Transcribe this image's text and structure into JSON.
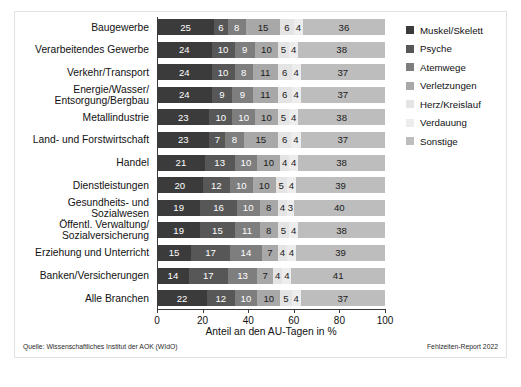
{
  "chart_data": {
    "type": "bar",
    "orientation": "horizontal",
    "stacked": true,
    "normalized_percent": true,
    "title": "",
    "xlabel": "Anteil an den AU-Tagen in %",
    "ylabel": "",
    "xlim": [
      0,
      100
    ],
    "xticks": [
      0,
      20,
      40,
      60,
      80,
      100
    ],
    "grid": false,
    "legend_position": "right",
    "series": [
      {
        "name": "Muskel/Skelett",
        "color": "#3b3b3b",
        "label_color": "#ffffff",
        "values": [
          25,
          24,
          24,
          24,
          23,
          23,
          21,
          20,
          19,
          19,
          15,
          14,
          22
        ]
      },
      {
        "name": "Psyche",
        "color": "#575757",
        "label_color": "#ffffff",
        "values": [
          6,
          10,
          10,
          9,
          10,
          7,
          13,
          12,
          16,
          15,
          17,
          17,
          12
        ]
      },
      {
        "name": "Atemwege",
        "color": "#7e7e7e",
        "label_color": "#ffffff",
        "values": [
          8,
          9,
          8,
          9,
          10,
          8,
          10,
          10,
          10,
          11,
          14,
          13,
          10
        ]
      },
      {
        "name": "Verletzungen",
        "color": "#a8a8a8",
        "label_color": "#1a1a1a",
        "values": [
          15,
          10,
          11,
          11,
          10,
          15,
          10,
          10,
          8,
          8,
          7,
          7,
          10
        ]
      },
      {
        "name": "Herz/Kreislauf",
        "color": "#e4e4e4",
        "label_color": "#1a1a1a",
        "values": [
          6,
          5,
          6,
          6,
          5,
          6,
          4,
          5,
          4,
          5,
          4,
          4,
          5
        ]
      },
      {
        "name": "Verdauung",
        "color": "#ededed",
        "label_color": "#1a1a1a",
        "values": [
          4,
          4,
          4,
          4,
          4,
          4,
          4,
          4,
          3,
          4,
          4,
          4,
          4
        ]
      },
      {
        "name": "Sonstige",
        "color": "#bdbdbd",
        "label_color": "#1a1a1a",
        "values": [
          36,
          38,
          37,
          37,
          38,
          37,
          38,
          39,
          40,
          38,
          39,
          41,
          37
        ]
      }
    ],
    "categories": [
      "Baugewerbe",
      "Verarbeitendes Gewerbe",
      "Verkehr/Transport",
      "Energie/Wasser/\nEntsorgung/Bergbau",
      "Metallindustrie",
      "Land- und Forstwirtschaft",
      "Handel",
      "Dienstleistungen",
      "Gesundheits- und Sozialwesen",
      "Öffentl. Verwaltung/\nSozialversicherung",
      "Erziehung und Unterricht",
      "Banken/Versicherungen",
      "Alle Branchen"
    ]
  },
  "footer": {
    "source": "Quelle: Wissenschaftliches Institut der AOK (WIdO)",
    "report": "Fehlzeiten-Report 2022"
  }
}
